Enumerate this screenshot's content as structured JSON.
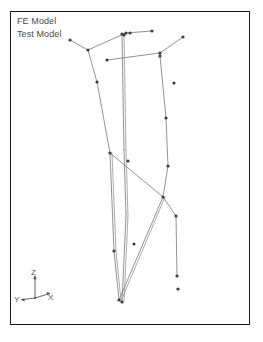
{
  "figure": {
    "background_color": "#ffffff",
    "frame_color": "#1a1a1a",
    "line_color": "#6e6e6e",
    "node_color": "#3c3c3c",
    "text_color": "#4a4a4a"
  },
  "legend": {
    "entries": [
      {
        "label": "FE Model"
      },
      {
        "label": "Test Model"
      }
    ]
  },
  "axis_triad": {
    "labels": {
      "z": "Z",
      "x": "X",
      "y": "Y"
    }
  },
  "chart_data": {
    "type": "scatter",
    "title": "",
    "xlabel": "X",
    "ylabel": "Z",
    "zlabel": "Y",
    "grid": false,
    "legend_position": "top-left",
    "series": [
      {
        "name": "FE Model",
        "color": "#6e6e6e",
        "nodes": [
          [
            70,
            40
          ],
          [
            88,
            50
          ],
          [
            183,
            37
          ],
          [
            160,
            53
          ],
          [
            126,
            33
          ],
          [
            152,
            31
          ],
          [
            107,
            60
          ],
          [
            122,
            34
          ],
          [
            124,
            35
          ],
          [
            97,
            82
          ],
          [
            110,
            153
          ],
          [
            119,
            300
          ],
          [
            160,
            56
          ],
          [
            166,
            118
          ],
          [
            168,
            166
          ],
          [
            163,
            197
          ],
          [
            176,
            216
          ],
          [
            177,
            276
          ],
          [
            130,
            33
          ],
          [
            114,
            251
          ],
          [
            122,
            302
          ]
        ],
        "edges": [
          [
            [
              70,
              40
            ],
            [
              88,
              50
            ]
          ],
          [
            [
              88,
              50
            ],
            [
              126,
              33
            ]
          ],
          [
            [
              126,
              33
            ],
            [
              152,
              31
            ]
          ],
          [
            [
              88,
              50
            ],
            [
              97,
              82
            ]
          ],
          [
            [
              97,
              82
            ],
            [
              110,
              153
            ]
          ],
          [
            [
              110,
              153
            ],
            [
              114,
              251
            ]
          ],
          [
            [
              114,
              251
            ],
            [
              119,
              300
            ]
          ],
          [
            [
              183,
              37
            ],
            [
              160,
              53
            ]
          ],
          [
            [
              160,
              53
            ],
            [
              107,
              60
            ]
          ],
          [
            [
              160,
              53
            ],
            [
              160,
              56
            ]
          ],
          [
            [
              160,
              56
            ],
            [
              166,
              118
            ]
          ],
          [
            [
              166,
              118
            ],
            [
              168,
              166
            ]
          ],
          [
            [
              168,
              166
            ],
            [
              163,
              197
            ]
          ],
          [
            [
              163,
              197
            ],
            [
              176,
              216
            ]
          ],
          [
            [
              176,
              216
            ],
            [
              177,
              276
            ]
          ],
          [
            [
              122,
              34
            ],
            [
              124,
              150
            ]
          ],
          [
            [
              124,
              150
            ],
            [
              126,
              216
            ]
          ],
          [
            [
              126,
              216
            ],
            [
              122,
              302
            ]
          ],
          [
            [
              110,
              153
            ],
            [
              163,
              197
            ]
          ],
          [
            [
              163,
              197
            ],
            [
              119,
              300
            ]
          ]
        ]
      },
      {
        "name": "Test Model",
        "color": "#8a8a8a",
        "nodes": [
          [
            174,
            83
          ],
          [
            128,
            161
          ],
          [
            134,
            244
          ],
          [
            178,
            289
          ]
        ],
        "edges": [
          [
            [
              124,
              34
            ],
            [
              126,
              150
            ]
          ],
          [
            [
              126,
              150
            ],
            [
              128,
              216
            ]
          ],
          [
            [
              128,
              216
            ],
            [
              124,
              302
            ]
          ],
          [
            [
              112,
              153
            ],
            [
              116,
              251
            ]
          ],
          [
            [
              116,
              251
            ],
            [
              121,
              301
            ]
          ],
          [
            [
              165,
              197
            ],
            [
              121,
              301
            ]
          ]
        ]
      }
    ],
    "xlim": [
      10,
      250
    ],
    "ylim": [
      11,
      325
    ]
  }
}
